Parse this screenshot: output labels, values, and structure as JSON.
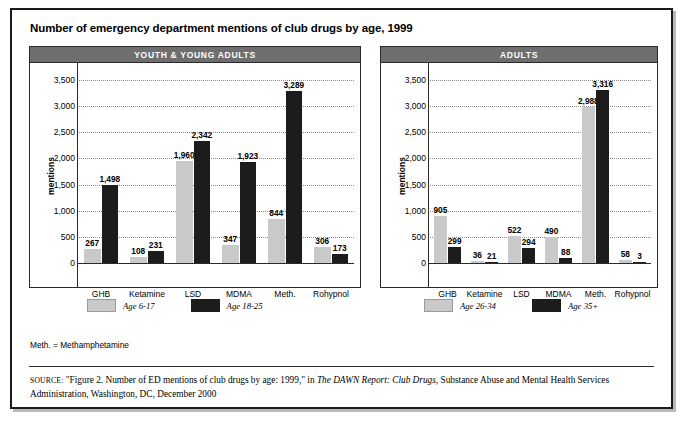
{
  "figure": {
    "title": "Number of emergency department mentions of club drugs by age, 1999",
    "footnote": "Meth. = Methamphetamine",
    "source": {
      "prefix": "SOURCE:",
      "part1": " \"Figure 2. Number of ED mentions of club drugs by age: 1999,\" in ",
      "italic": "The DAWN Report: Club Drugs",
      "part2": ", Substance Abuse and Mental Health Services Administration, Washington, DC, December 2000"
    }
  },
  "colors": {
    "light_series": "#c9c9c9",
    "dark_series": "#1c1c1c",
    "panel_header_bg": "#6e6e6e",
    "frame": "#1b1b1b"
  },
  "panels": [
    {
      "id": "youth",
      "header": "YOUTH & YOUNG ADULTS"
    },
    {
      "id": "adults",
      "header": "ADULTS"
    }
  ],
  "chart_data": [
    {
      "type": "bar",
      "title": "YOUTH & YOUNG ADULTS",
      "xlabel": "",
      "ylabel": "mentions",
      "ylim": [
        0,
        3500
      ],
      "yticks": [
        0,
        500,
        1000,
        1500,
        2000,
        2500,
        3000,
        3500
      ],
      "ytick_labels": [
        "0",
        "500",
        "1,000",
        "1,500",
        "2,000",
        "2,500",
        "3,000",
        "3,500"
      ],
      "grid": true,
      "legend_position": "below",
      "categories": [
        "GHB",
        "Ketamine",
        "LSD",
        "MDMA",
        "Meth.",
        "Rohypnol"
      ],
      "series": [
        {
          "name": "Age 6-17",
          "color": "#c9c9c9",
          "values": [
            267,
            108,
            1960,
            347,
            844,
            306
          ],
          "value_labels": [
            "267",
            "108",
            "1,960",
            "347",
            "844",
            "306"
          ]
        },
        {
          "name": "Age 18-25",
          "color": "#1c1c1c",
          "values": [
            1498,
            231,
            2342,
            1923,
            3289,
            173
          ],
          "value_labels": [
            "1,498",
            "231",
            "2,342",
            "1,923",
            "3,289",
            "173"
          ]
        }
      ]
    },
    {
      "type": "bar",
      "title": "ADULTS",
      "xlabel": "",
      "ylabel": "mentions",
      "ylim": [
        0,
        3500
      ],
      "yticks": [
        0,
        500,
        1000,
        1500,
        2000,
        2500,
        3000,
        3500
      ],
      "ytick_labels": [
        "0",
        "500",
        "1,000",
        "1,500",
        "2,000",
        "2,500",
        "3,000",
        "3,500"
      ],
      "grid": true,
      "legend_position": "below",
      "categories": [
        "GHB",
        "Ketamine",
        "LSD",
        "MDMA",
        "Meth.",
        "Rohypnol"
      ],
      "series": [
        {
          "name": "Age 26-34",
          "color": "#c9c9c9",
          "values": [
            905,
            36,
            522,
            490,
            2988,
            58
          ],
          "value_labels": [
            "905",
            "36",
            "522",
            "490",
            "2,988",
            "58"
          ]
        },
        {
          "name": "Age 35+",
          "color": "#1c1c1c",
          "values": [
            299,
            21,
            294,
            88,
            3316,
            3
          ],
          "value_labels": [
            "299",
            "21",
            "294",
            "88",
            "3,316",
            "3"
          ]
        }
      ]
    }
  ]
}
